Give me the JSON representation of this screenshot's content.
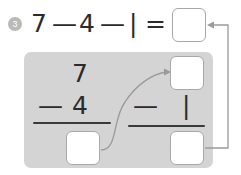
{
  "exercise": {
    "number": "3",
    "equation": {
      "terms": [
        "7",
        "—",
        "4",
        "—",
        "|",
        "="
      ],
      "minuend": "7",
      "operator": "—",
      "subtrahend_1": "4",
      "subtrahend_2": "|",
      "equals": "=",
      "answer_value": ""
    }
  },
  "work_panel": {
    "left_problem": {
      "minuend": "7",
      "operator": "—",
      "subtrahend": "4",
      "difference_value": ""
    },
    "right_problem": {
      "carry_value": "",
      "operator": "—",
      "subtrahend": "|",
      "difference_value": ""
    }
  },
  "connectors": [
    {
      "name": "left-difference-to-right-carry",
      "from": "box-diff-left",
      "to": "box-carry-right",
      "style": "curved-arrow"
    },
    {
      "name": "right-difference-to-total",
      "from": "box-diff-right",
      "to": "box-total",
      "style": "elbow-arrow"
    }
  ],
  "colors": {
    "panel_background": "#d4d4d4",
    "page_background": "#ffffff",
    "text": "#2b2b2b",
    "box_border": "#a8a8a8",
    "rule": "#3a3a3a",
    "marker_circle": "#b9b9b9",
    "connector": "#9a9a9a"
  }
}
